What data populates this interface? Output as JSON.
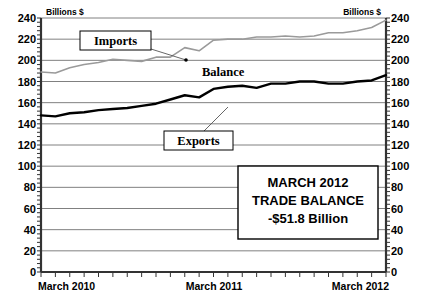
{
  "chart_data": {
    "type": "line",
    "title": "",
    "xlabel": "",
    "ylabel": "Billions $",
    "unit_label_left": "Billions $",
    "unit_label_right": "Billions $",
    "ylim": [
      0,
      240
    ],
    "ytick_values": [
      0,
      20,
      40,
      60,
      80,
      100,
      120,
      140,
      160,
      180,
      200,
      220,
      240
    ],
    "ytick_labels": [
      "0",
      "20",
      "40",
      "60",
      "80",
      "100",
      "120",
      "140",
      "160",
      "180",
      "200",
      "220",
      "240"
    ],
    "grid": true,
    "legend_position": "inline-callouts",
    "x_start_label": "March 2010",
    "x_mid_label": "March 2011",
    "x_end_label": "March 2012",
    "x_tick_count": 25,
    "x": [
      "Mar 2010",
      "Apr 2010",
      "May 2010",
      "Jun 2010",
      "Jul 2010",
      "Aug 2010",
      "Sep 2010",
      "Oct 2010",
      "Nov 2010",
      "Dec 2010",
      "Jan 2011",
      "Feb 2011",
      "Mar 2011",
      "Apr 2011",
      "May 2011",
      "Jun 2011",
      "Jul 2011",
      "Aug 2011",
      "Sep 2011",
      "Oct 2011",
      "Nov 2011",
      "Dec 2011",
      "Jan 2012",
      "Feb 2012",
      "Mar 2012"
    ],
    "series": [
      {
        "name": "Imports",
        "color": "#9a9a9a",
        "values": [
          189,
          188,
          193,
          196,
          198,
          201,
          200,
          199,
          203,
          203,
          212,
          209,
          219,
          220,
          220,
          222,
          222,
          223,
          222,
          223,
          226,
          226,
          228,
          231,
          238
        ]
      },
      {
        "name": "Exports",
        "color": "#000000",
        "values": [
          148,
          147,
          150,
          151,
          153,
          154,
          155,
          157,
          159,
          163,
          167,
          165,
          173,
          175,
          176,
          174,
          178,
          178,
          180,
          180,
          178,
          178,
          180,
          181,
          186
        ]
      }
    ],
    "annotations": [
      {
        "name": "imports-callout",
        "text": "Imports",
        "target_x": "Sep 2010",
        "target_y": 203
      },
      {
        "name": "exports-callout",
        "text": "Exports",
        "target_x": "Feb 2012",
        "target_y": 181
      },
      {
        "name": "balance-label",
        "text": "Balance"
      }
    ]
  },
  "annotation_box": {
    "name": "trade-balance-summary",
    "line1": "MARCH 2012",
    "line2": "TRADE BALANCE",
    "line3": "-$51.8 Billion"
  },
  "labels": {
    "imports": "Imports",
    "exports": "Exports",
    "balance": "Balance",
    "billions_left": "Billions $",
    "billions_right": "Billions $",
    "x_start": "March 2010",
    "x_mid": "March 2011",
    "x_end": "March 2012"
  },
  "ticks": {
    "y": [
      "240",
      "220",
      "200",
      "180",
      "160",
      "140",
      "120",
      "100",
      "80",
      "60",
      "40",
      "20",
      "0"
    ]
  },
  "colors": {
    "imports_line": "#9a9a9a",
    "exports_line": "#000000",
    "gridline": "#808080",
    "axis": "#333333",
    "background": "#ffffff"
  }
}
